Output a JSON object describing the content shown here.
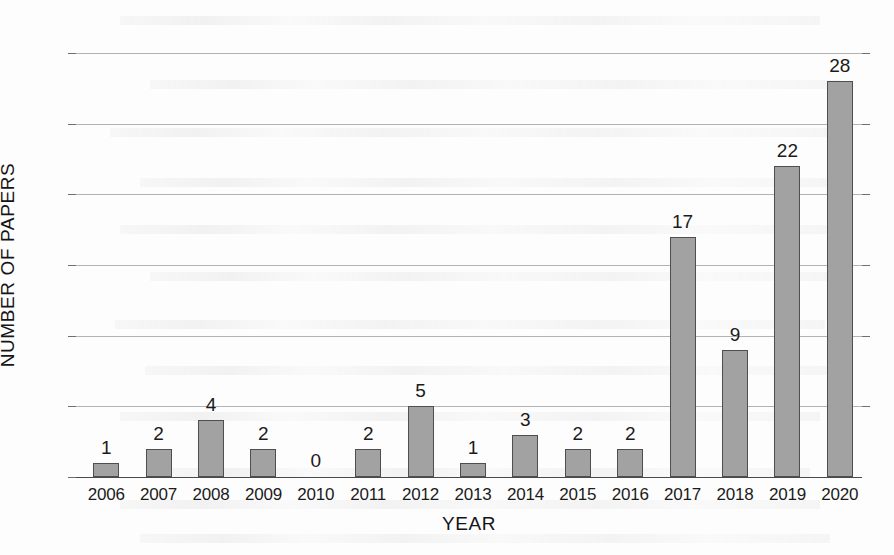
{
  "chart_data": {
    "type": "bar",
    "title": "",
    "xlabel": "YEAR",
    "ylabel": "NUMBER OF PAPERS",
    "categories": [
      "2006",
      "2007",
      "2008",
      "2009",
      "2010",
      "2011",
      "2012",
      "2013",
      "2014",
      "2015",
      "2016",
      "2017",
      "2018",
      "2019",
      "2020"
    ],
    "values": [
      1,
      2,
      4,
      2,
      0,
      2,
      5,
      1,
      3,
      2,
      2,
      17,
      9,
      22,
      28
    ],
    "value_labels": [
      "1",
      "2",
      "4",
      "2",
      "0",
      "2",
      "5",
      "1",
      "3",
      "2",
      "2",
      "17",
      "9",
      "22",
      "28"
    ],
    "ylim": [
      0,
      30
    ],
    "ytick_labels": [
      "0",
      "5",
      "10",
      "15",
      "20",
      "25",
      "30"
    ],
    "ytick_values": [
      0,
      5,
      10,
      15,
      20,
      25,
      30
    ],
    "grid": true,
    "legend": "none",
    "colors": {
      "bar_fill": "#a2a2a2",
      "bar_stroke": "#4e4e4e",
      "gridline": "#9a9a9a",
      "axis": "#4a4a4a",
      "text": "#1b1b1b",
      "background": "#fdfdfd"
    }
  }
}
